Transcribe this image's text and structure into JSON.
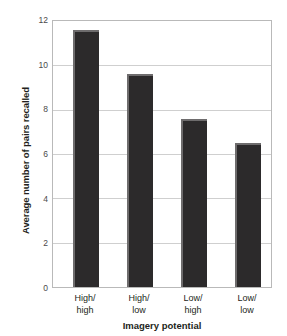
{
  "chart_data": {
    "type": "bar",
    "title": "",
    "categories": [
      "High/high",
      "High/low",
      "Low/high",
      "Low/low"
    ],
    "category_lines": [
      [
        "High/",
        "high"
      ],
      [
        "High/",
        "low"
      ],
      [
        "Low/",
        "high"
      ],
      [
        "Low/",
        "low"
      ]
    ],
    "values": [
      11.6,
      9.6,
      7.6,
      6.5
    ],
    "xlabel": "Imagery potential",
    "ylabel": "Average number of pairs recalled",
    "ylim": [
      0,
      12
    ],
    "yticks": [
      0,
      2,
      4,
      6,
      8,
      10,
      12
    ],
    "ytick_labels": [
      "0",
      "2",
      "4",
      "6",
      "8",
      "10",
      "12"
    ],
    "grid": true,
    "legend": false,
    "legend_position": "none",
    "bar_color": "#2c2a2b",
    "bar_edge_color": "#6e6c6d",
    "gridline_color": "#cfcfcf",
    "plot_border_color": "#b9b9b9",
    "background_color": "#ffffff"
  }
}
